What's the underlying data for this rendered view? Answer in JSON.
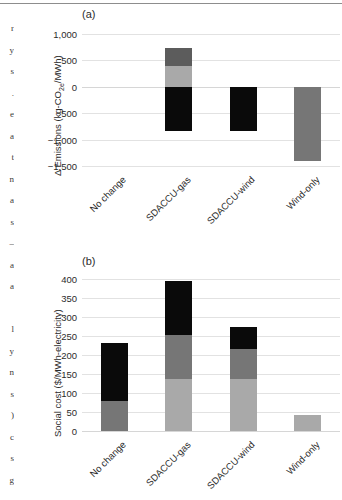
{
  "page": {
    "margin_text_fragment": "r\ny\ns\n.\ne\na\nt\nn\na\ns\n–\na\na\n\nl\ny\nn\ns\n)\nc\ns\ng\n\nU\n-"
  },
  "panels": [
    {
      "tag": "(a)",
      "chart_data": {
        "type": "bar",
        "stacked": true,
        "title": "",
        "xlabel": "",
        "ylabel": "Δ Emissions (kg-CO2e/MWh)",
        "ylabel_main": "Δ Emissions (kg-CO",
        "ylabel_sub": "2e",
        "ylabel_tail": "/MWh)",
        "categories": [
          "No change",
          "SDACCU-gas",
          "SDACCU-wind",
          "Wind-only"
        ],
        "ylim": [
          -1500,
          1000
        ],
        "yticks": [
          1000,
          500,
          0,
          -500,
          -1000,
          -1500
        ],
        "ytick_labels": [
          "1,000",
          "500",
          "0",
          "−500",
          "−1,000",
          "−1,500"
        ],
        "grid": true,
        "legend": "none",
        "series": [
          {
            "name": "dark-gray-segment",
            "color": "#5c5c5c",
            "values": [
              0,
              340,
              0,
              0
            ]
          },
          {
            "name": "light-gray-segment",
            "color": "#a9a9a9",
            "values": [
              0,
              390,
              0,
              -1400
            ]
          },
          {
            "name": "black-segment",
            "color": "#0a0a0a",
            "values": [
              0,
              -830,
              -830,
              0
            ]
          }
        ],
        "bars": [
          {
            "category": "No change",
            "segments": []
          },
          {
            "category": "SDACCU-gas",
            "segments": [
              {
                "color": "#0a0a0a",
                "from": 0,
                "to": -830
              },
              {
                "color": "#a9a9a9",
                "from": 0,
                "to": 390
              },
              {
                "color": "#5c5c5c",
                "from": 390,
                "to": 730
              }
            ]
          },
          {
            "category": "SDACCU-wind",
            "segments": [
              {
                "color": "#0a0a0a",
                "from": 0,
                "to": -830
              }
            ]
          },
          {
            "category": "Wind-only",
            "segments": [
              {
                "color": "#767676",
                "from": 0,
                "to": -1400
              }
            ]
          }
        ]
      }
    },
    {
      "tag": "(b)",
      "chart_data": {
        "type": "bar",
        "stacked": true,
        "title": "",
        "xlabel": "",
        "ylabel": "Social cost ($/MWh-electricity)",
        "categories": [
          "No change",
          "SDACCU-gas",
          "SDACCU-wind",
          "Wind-only"
        ],
        "ylim": [
          0,
          400
        ],
        "yticks": [
          400,
          350,
          300,
          250,
          200,
          150,
          100,
          50,
          0
        ],
        "ytick_labels": [
          "400",
          "350",
          "300",
          "250",
          "200",
          "150",
          "100",
          "50",
          "0"
        ],
        "grid": true,
        "legend": "none",
        "series": [
          {
            "name": "light-gray-segment",
            "color": "#a9a9a9",
            "values": [
              0,
              137,
              137,
              43
            ]
          },
          {
            "name": "mid-gray-segment",
            "color": "#767676",
            "values": [
              78,
              116,
              78,
              0
            ]
          },
          {
            "name": "black-segment",
            "color": "#0a0a0a",
            "values": [
              153,
              143,
              60,
              0
            ]
          }
        ],
        "bars": [
          {
            "category": "No change",
            "total": 231,
            "segments": [
              {
                "color": "#767676",
                "from": 0,
                "to": 78
              },
              {
                "color": "#0a0a0a",
                "from": 78,
                "to": 231
              }
            ]
          },
          {
            "category": "SDACCU-gas",
            "total": 396,
            "segments": [
              {
                "color": "#a9a9a9",
                "from": 0,
                "to": 137
              },
              {
                "color": "#767676",
                "from": 137,
                "to": 253
              },
              {
                "color": "#0a0a0a",
                "from": 253,
                "to": 396
              }
            ]
          },
          {
            "category": "SDACCU-wind",
            "total": 275,
            "segments": [
              {
                "color": "#a9a9a9",
                "from": 0,
                "to": 137
              },
              {
                "color": "#767676",
                "from": 137,
                "to": 215
              },
              {
                "color": "#0a0a0a",
                "from": 215,
                "to": 275
              }
            ]
          },
          {
            "category": "Wind-only",
            "total": 43,
            "segments": [
              {
                "color": "#a9a9a9",
                "from": 0,
                "to": 43
              }
            ]
          }
        ]
      }
    }
  ]
}
